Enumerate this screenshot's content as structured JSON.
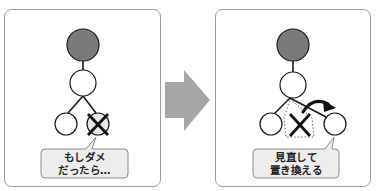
{
  "diagram": {
    "colors": {
      "panel_border": "#9a9a9a",
      "root_fill": "#7a7a7a",
      "node_fill": "#ffffff",
      "failed_node_fill": "#e8e8e8",
      "edge": "#1a1a1a",
      "arrow_fill": "#a6a6a6",
      "callout_fill": "#ededed",
      "callout_border": "#8a8a8a"
    },
    "left_panel": {
      "label": "before",
      "callout": {
        "line1": "もしダメ",
        "line2": "だったら…"
      },
      "nodes": [
        "root",
        "child",
        "left-leaf",
        "failed-leaf"
      ]
    },
    "transition_arrow": {
      "direction": "right"
    },
    "right_panel": {
      "label": "after",
      "callout": {
        "line1": "見直して",
        "line2": "置き換える"
      },
      "nodes": [
        "root",
        "child",
        "left-leaf",
        "removed-leaf",
        "replacement-leaf"
      ]
    }
  }
}
